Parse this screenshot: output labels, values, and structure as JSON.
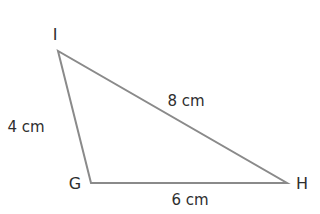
{
  "diagram": {
    "type": "triangle",
    "stroke_color": "#8a8a8a",
    "text_color": "#2e2e2e",
    "vertices": [
      {
        "name": "I",
        "x": 58,
        "y": 51,
        "label_x": 55,
        "label_y": 35
      },
      {
        "name": "G",
        "x": 91,
        "y": 183,
        "label_x": 75,
        "label_y": 184
      },
      {
        "name": "H",
        "x": 287,
        "y": 183,
        "label_x": 302,
        "label_y": 184
      }
    ],
    "sides": [
      {
        "from": "I",
        "to": "G",
        "length": "4 cm",
        "label_x": 26,
        "label_y": 127
      },
      {
        "from": "I",
        "to": "H",
        "length": "8 cm",
        "label_x": 186,
        "label_y": 101
      },
      {
        "from": "G",
        "to": "H",
        "length": "6 cm",
        "label_x": 190,
        "label_y": 200
      }
    ]
  }
}
